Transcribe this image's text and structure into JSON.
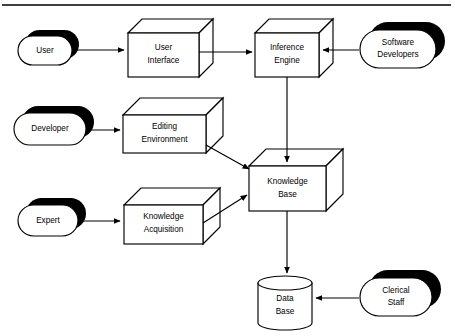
{
  "diagram": {
    "top_rule": {
      "x1": 2,
      "y1": 5,
      "x2": 451,
      "y2": 5
    },
    "colors": {
      "stroke": "#000000",
      "fill": "#ffffff",
      "shadow": "#000000"
    },
    "actors": [
      {
        "id": "user",
        "label": "User",
        "shape": "pill",
        "x": 18,
        "y": 36,
        "w": 54,
        "h": 29,
        "shadow_dx": 7,
        "shadow_dy": -6
      },
      {
        "id": "software-developers",
        "label_line1": "Software",
        "label_line2": "Developers",
        "shape": "pill",
        "x": 360,
        "y": 30,
        "w": 76,
        "h": 38,
        "shadow_dx": 9,
        "shadow_dy": -8
      },
      {
        "id": "developer",
        "label": "Developer",
        "shape": "pill",
        "x": 14,
        "y": 113,
        "w": 72,
        "h": 32,
        "shadow_dx": 8,
        "shadow_dy": -7
      },
      {
        "id": "expert",
        "label": "Expert",
        "shape": "pill",
        "x": 18,
        "y": 205,
        "w": 60,
        "h": 31,
        "shadow_dx": 8,
        "shadow_dy": -7
      },
      {
        "id": "clerical-staff",
        "label_line1": "Clerical",
        "label_line2": "Staff",
        "shape": "pill",
        "x": 360,
        "y": 278,
        "w": 72,
        "h": 38,
        "shadow_dx": 9,
        "shadow_dy": -8
      }
    ],
    "components": [
      {
        "id": "user-interface",
        "label_line1": "User",
        "label_line2": "Interface",
        "shape": "cuboid",
        "x": 128,
        "y": 33,
        "w": 71,
        "h": 44,
        "depth": 14
      },
      {
        "id": "inference-engine",
        "label_line1": "Inference",
        "label_line2": "Engine",
        "shape": "cuboid",
        "x": 255,
        "y": 33,
        "w": 64,
        "h": 44,
        "depth": 14
      },
      {
        "id": "editing-environment",
        "label_line1": "Editing",
        "label_line2": "Environment",
        "shape": "cuboid",
        "x": 123,
        "y": 115,
        "w": 83,
        "h": 38,
        "depth": 17
      },
      {
        "id": "knowledge-acquisition",
        "label_line1": "Knowledge",
        "label_line2": "Acquisition",
        "shape": "cuboid",
        "x": 124,
        "y": 205,
        "w": 79,
        "h": 39,
        "depth": 17
      },
      {
        "id": "knowledge-base",
        "label_line1": "Knowledge",
        "label_line2": "Base",
        "shape": "cuboid",
        "x": 249,
        "y": 166,
        "w": 77,
        "h": 45,
        "depth": 17
      }
    ],
    "datastores": [
      {
        "id": "data-base",
        "label_line1": "Data",
        "label_line2": "Base",
        "shape": "cylinder",
        "x": 258,
        "y": 276,
        "w": 54,
        "h": 54,
        "ellipse_ry": 7
      }
    ],
    "connectors": [
      {
        "id": "user-to-user-interface",
        "from": "user",
        "to": "user-interface",
        "type": "arrow-right",
        "path": "M 76 50 L 125 50"
      },
      {
        "id": "user-interface-to-inference-engine",
        "from": "user-interface",
        "to": "inference-engine",
        "type": "arrow-right",
        "path": "M 199 52 L 252 52"
      },
      {
        "id": "software-developers-to-inference-engine",
        "from": "software-developers",
        "to": "inference-engine",
        "type": "arrow-left",
        "path": "M 358 50 L 322 50"
      },
      {
        "id": "inference-engine-to-knowledge-base",
        "from": "inference-engine",
        "to": "knowledge-base",
        "type": "arrow-down",
        "path": "M 287 77 L 287 163"
      },
      {
        "id": "developer-to-editing-environment",
        "from": "developer",
        "to": "editing-environment",
        "type": "arrow-right",
        "path": "M 88 130 L 120 130"
      },
      {
        "id": "editing-environment-to-knowledge-base",
        "from": "editing-environment",
        "to": "knowledge-base",
        "type": "arrow-diagonal-down-right",
        "path": "M 207 146 L 248 169"
      },
      {
        "id": "expert-to-knowledge-acquisition",
        "from": "expert",
        "to": "knowledge-acquisition",
        "type": "arrow-right",
        "path": "M 80 221 L 121 221"
      },
      {
        "id": "knowledge-acquisition-to-knowledge-base",
        "from": "knowledge-acquisition",
        "to": "knowledge-base",
        "type": "arrow-diagonal-up-right",
        "path": "M 204 222 L 246 194"
      },
      {
        "id": "knowledge-base-to-data-base",
        "from": "knowledge-base",
        "to": "data-base",
        "type": "arrow-down",
        "path": "M 287 211 L 287 274"
      },
      {
        "id": "clerical-staff-to-data-base",
        "from": "clerical-staff",
        "to": "data-base",
        "type": "arrow-left",
        "path": "M 358 298 L 315 298"
      }
    ]
  }
}
